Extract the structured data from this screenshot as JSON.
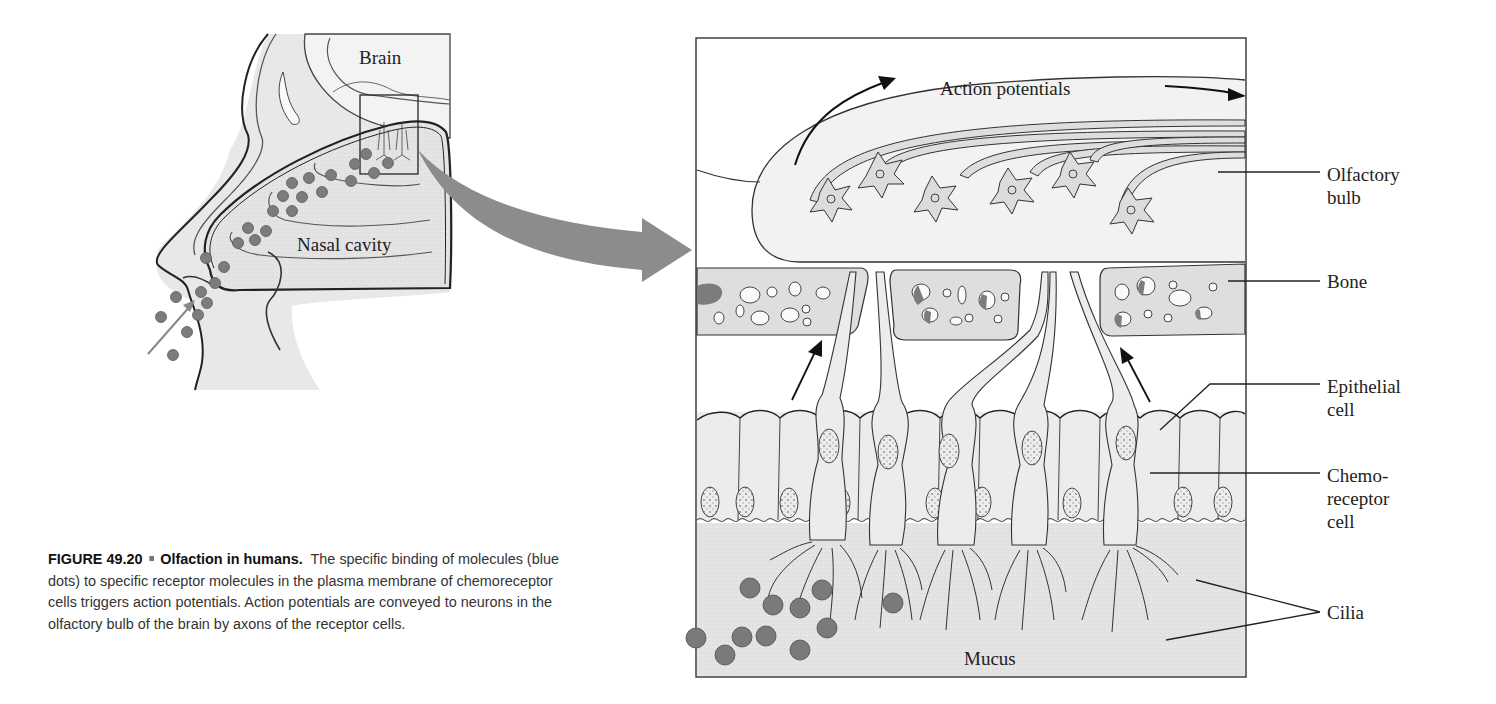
{
  "figure": {
    "number": "FIGURE 49.20",
    "title": "Olfaction in humans.",
    "caption": "The specific binding of molecules (blue dots) to specific receptor molecules in the plasma membrane of chemoreceptor cells triggers action potentials. Action potentials are conveyed to neurons in the olfactory bulb of the brain by axons of the receptor cells."
  },
  "head_diagram": {
    "labels": {
      "brain": "Brain",
      "nasal_cavity": "Nasal cavity"
    }
  },
  "detail_diagram": {
    "labels": {
      "action_potentials": "Action potentials",
      "mucus": "Mucus"
    },
    "callouts": [
      {
        "line1": "Olfactory",
        "line2": "bulb"
      },
      {
        "line1": "Bone",
        "line2": ""
      },
      {
        "line1": "Epithelial",
        "line2": "cell"
      },
      {
        "line1": "Chemo-",
        "line2": "receptor",
        "line3": "cell"
      },
      {
        "line1": "Cilia",
        "line2": ""
      }
    ]
  },
  "colors": {
    "tissue_fill": "#e6e6e6",
    "bulb_fill": "#f1f1f1",
    "bone_fill": "#dcdcdc",
    "odorant_dot": "#7a7a7a",
    "big_arrow": "#8c8c8c",
    "outline": "#333333"
  }
}
